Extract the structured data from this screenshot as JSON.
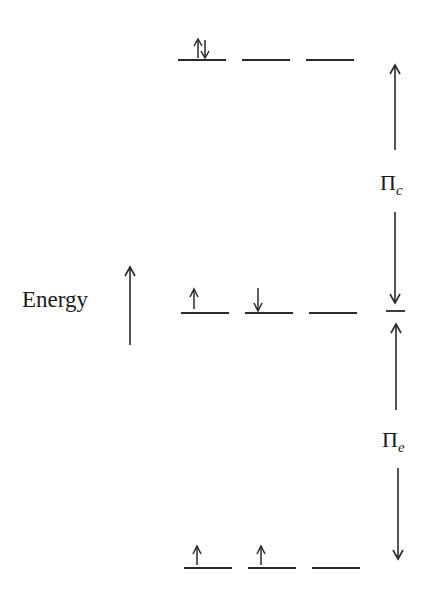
{
  "diagram": {
    "type": "energy-level-diagram",
    "axis_label": "Energy",
    "axis_arrow": "up",
    "levels": [
      {
        "name": "upper",
        "orbitals": [
          {
            "electrons": [
              "up",
              "down"
            ]
          },
          {
            "electrons": []
          },
          {
            "electrons": []
          }
        ]
      },
      {
        "name": "middle",
        "orbitals": [
          {
            "electrons": [
              "up"
            ]
          },
          {
            "electrons": [
              "down"
            ]
          },
          {
            "electrons": []
          }
        ]
      },
      {
        "name": "lower",
        "orbitals": [
          {
            "electrons": [
              "up"
            ]
          },
          {
            "electrons": [
              "up"
            ]
          },
          {
            "electrons": []
          }
        ]
      }
    ],
    "gaps": [
      {
        "symbol": "Π",
        "subscript": "c",
        "between": [
          "upper",
          "middle"
        ]
      },
      {
        "symbol": "Π",
        "subscript": "e",
        "between": [
          "middle",
          "lower"
        ]
      }
    ]
  },
  "labels": {
    "energy": "Energy",
    "pi_c_symbol": "Π",
    "pi_c_sub": "c",
    "pi_e_symbol": "Π",
    "pi_e_sub": "e"
  },
  "colors": {
    "ink": "#2a2a2a",
    "background": "#ffffff"
  }
}
